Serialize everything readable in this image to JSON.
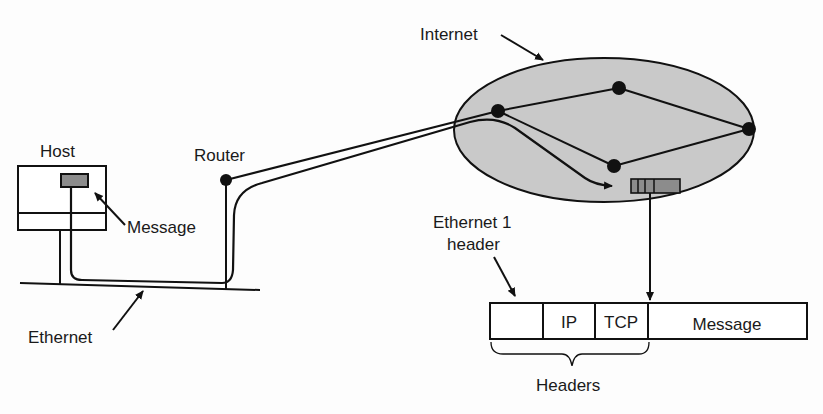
{
  "labels": {
    "internet": "Internet",
    "host": "Host",
    "router": "Router",
    "message": "Message",
    "ethernet": "Ethernet",
    "eth_header_line1": "Ethernet 1",
    "eth_header_line2": "header",
    "headers": "Headers"
  },
  "packet": {
    "fields": [
      "",
      "IP",
      "TCP",
      "Message"
    ]
  },
  "colors": {
    "ink": "#111111",
    "cloud_fill": "#c9c9c9",
    "packet_fill": "#8c8c8c"
  }
}
